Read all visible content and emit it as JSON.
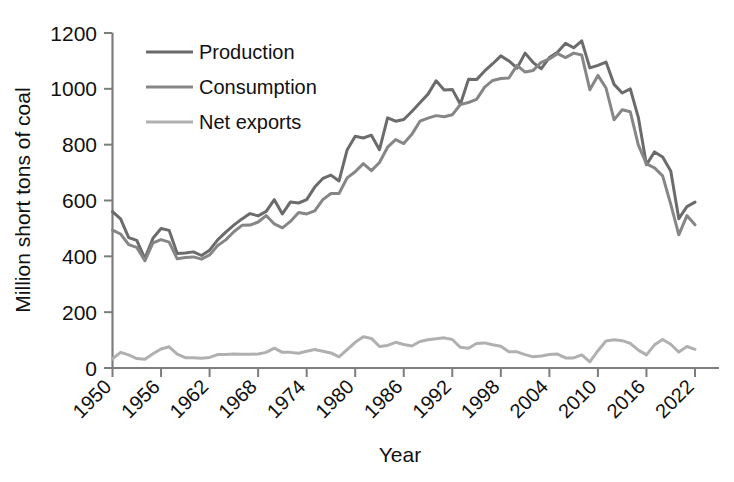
{
  "chart_data": {
    "type": "line",
    "title": "",
    "xlabel": "Year",
    "ylabel": "Million short tons of coal",
    "xlim": [
      1950,
      2022
    ],
    "ylim": [
      0,
      1200
    ],
    "ytick_step": 200,
    "xtick_step": 6,
    "grid": false,
    "legend_position": "upper-left-inside",
    "xticks": [
      "1950",
      "1956",
      "1962",
      "1968",
      "1974",
      "1980",
      "1986",
      "1992",
      "1998",
      "2004",
      "2010",
      "2016",
      "2022"
    ],
    "yticks": [
      "0",
      "200",
      "400",
      "600",
      "800",
      "1000",
      "1200"
    ],
    "x": [
      1950,
      1951,
      1952,
      1953,
      1954,
      1955,
      1956,
      1957,
      1958,
      1959,
      1960,
      1961,
      1962,
      1963,
      1964,
      1965,
      1966,
      1967,
      1968,
      1969,
      1970,
      1971,
      1972,
      1973,
      1974,
      1975,
      1976,
      1977,
      1978,
      1979,
      1980,
      1981,
      1982,
      1983,
      1984,
      1985,
      1986,
      1987,
      1988,
      1989,
      1990,
      1991,
      1992,
      1993,
      1994,
      1995,
      1996,
      1997,
      1998,
      1999,
      2000,
      2001,
      2002,
      2003,
      2004,
      2005,
      2006,
      2007,
      2008,
      2009,
      2010,
      2011,
      2012,
      2013,
      2014,
      2015,
      2016,
      2017,
      2018,
      2019,
      2020,
      2021,
      2022
    ],
    "series": [
      {
        "name": "Production",
        "color": "#6b6b6b",
        "width": 3.0,
        "values": [
          560,
          534,
          467,
          457,
          392,
          465,
          500,
          493,
          410,
          412,
          416,
          403,
          422,
          459,
          487,
          512,
          534,
          553,
          545,
          561,
          603,
          552,
          595,
          591,
          603,
          648,
          679,
          691,
          670,
          781,
          830,
          824,
          834,
          782,
          896,
          884,
          890,
          919,
          950,
          981,
          1029,
          996,
          998,
          945,
          1034,
          1033,
          1064,
          1090,
          1118,
          1100,
          1074,
          1128,
          1094,
          1072,
          1112,
          1131,
          1163,
          1147,
          1172,
          1075,
          1084,
          1096,
          1016,
          985,
          1000,
          897,
          728,
          774,
          756,
          706,
          535,
          578,
          594
        ]
      },
      {
        "name": "Consumption",
        "color": "#868686",
        "width": 3.0,
        "values": [
          494,
          480,
          442,
          432,
          384,
          448,
          460,
          451,
          391,
          396,
          398,
          390,
          405,
          439,
          459,
          488,
          511,
          512,
          523,
          546,
          516,
          502,
          525,
          557,
          552,
          563,
          603,
          625,
          625,
          681,
          703,
          732,
          707,
          736,
          791,
          818,
          804,
          837,
          884,
          895,
          904,
          900,
          907,
          944,
          951,
          962,
          1006,
          1030,
          1037,
          1039,
          1084,
          1060,
          1066,
          1095,
          1107,
          1126,
          1112,
          1128,
          1121,
          997,
          1048,
          1003,
          889,
          925,
          918,
          798,
          731,
          717,
          688,
          587,
          477,
          546,
          513
        ]
      },
      {
        "name": "Net exports",
        "color": "#b0b0b0",
        "width": 3.0,
        "values": [
          33,
          56,
          47,
          34,
          31,
          51,
          68,
          76,
          50,
          37,
          37,
          35,
          38,
          48,
          48,
          50,
          49,
          49,
          50,
          56,
          71,
          56,
          56,
          53,
          60,
          66,
          60,
          54,
          40,
          66,
          92,
          112,
          106,
          77,
          81,
          92,
          84,
          79,
          95,
          101,
          105,
          108,
          102,
          74,
          71,
          88,
          90,
          83,
          78,
          58,
          58,
          48,
          40,
          43,
          48,
          50,
          36,
          36,
          47,
          22,
          62,
          97,
          101,
          98,
          88,
          64,
          47,
          83,
          102,
          85,
          57,
          77,
          67
        ]
      }
    ]
  },
  "legend": {
    "items": [
      {
        "label": "Production"
      },
      {
        "label": "Consumption"
      },
      {
        "label": "Net exports"
      }
    ]
  },
  "axes": {
    "x_title": "Year",
    "y_title": "Million short tons of coal"
  }
}
